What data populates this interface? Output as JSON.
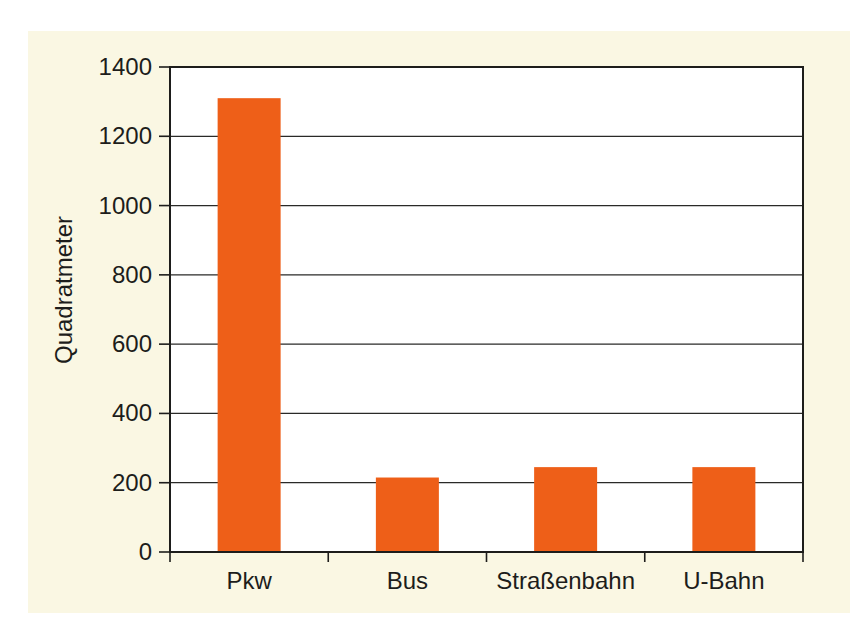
{
  "chart_data": {
    "type": "bar",
    "categories": [
      "Pkw",
      "Bus",
      "Straßenbahn",
      "U-Bahn"
    ],
    "values": [
      1310,
      215,
      245,
      245
    ],
    "title": "",
    "xlabel": "",
    "ylabel": "Quadratmeter",
    "ylim": [
      0,
      1400
    ],
    "yticks": [
      0,
      200,
      400,
      600,
      800,
      1000,
      1200,
      1400
    ],
    "grid": "horizontal",
    "legend": "none",
    "colors": {
      "bar": "#ee5f18",
      "panel_background": "#faf7e3",
      "plot_background": "#ffffff",
      "axis": "#1d1d1b",
      "gridline": "#2a2a28",
      "text": "#1d1d1b"
    }
  }
}
